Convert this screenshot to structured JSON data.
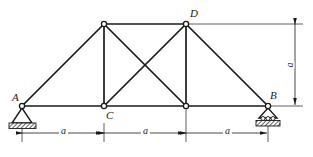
{
  "figure": {
    "type": "truss-diagram",
    "background_color": "#ffffff",
    "line_color": "#1a1a1a",
    "hatch_color": "#4d4d4d"
  },
  "nodes": [
    {
      "id": "A",
      "label": "A",
      "x": 22,
      "y": 106,
      "label_dx": -10,
      "label_dy": -14,
      "support": "pin"
    },
    {
      "id": "C",
      "label": "C",
      "x": 104,
      "y": 106,
      "label_dx": 2,
      "label_dy": 4,
      "support": "none"
    },
    {
      "id": "E",
      "label": "",
      "x": 186,
      "y": 106,
      "label_dx": 0,
      "label_dy": 0,
      "support": "none"
    },
    {
      "id": "B",
      "label": "B",
      "x": 268,
      "y": 106,
      "label_dx": 2,
      "label_dy": -16,
      "support": "roller"
    },
    {
      "id": "F",
      "label": "",
      "x": 104,
      "y": 24,
      "label_dx": 0,
      "label_dy": 0,
      "support": "none"
    },
    {
      "id": "D",
      "label": "D",
      "x": 186,
      "y": 24,
      "label_dx": 4,
      "label_dy": -16,
      "support": "none"
    }
  ],
  "members": [
    {
      "from": "A",
      "to": "C",
      "kind": "bottom-chord"
    },
    {
      "from": "C",
      "to": "E",
      "kind": "bottom-chord"
    },
    {
      "from": "E",
      "to": "B",
      "kind": "bottom-chord"
    },
    {
      "from": "F",
      "to": "D",
      "kind": "top-chord"
    },
    {
      "from": "A",
      "to": "F",
      "kind": "diagonal"
    },
    {
      "from": "F",
      "to": "C",
      "kind": "vertical"
    },
    {
      "from": "F",
      "to": "E",
      "kind": "diagonal"
    },
    {
      "from": "C",
      "to": "D",
      "kind": "diagonal"
    },
    {
      "from": "D",
      "to": "E",
      "kind": "vertical"
    },
    {
      "from": "D",
      "to": "B",
      "kind": "diagonal"
    }
  ],
  "dimensions": {
    "horizontal": [
      {
        "label": "a",
        "x1": 22,
        "x2": 104,
        "y": 133
      },
      {
        "label": "a",
        "x1": 104,
        "x2": 186,
        "y": 133
      },
      {
        "label": "a",
        "x1": 186,
        "x2": 268,
        "y": 133
      }
    ],
    "vertical": [
      {
        "label": "a",
        "x": 295,
        "y1": 24,
        "y2": 106
      }
    ]
  },
  "supports": {
    "pin": {
      "at": "A",
      "description": "pinned-support"
    },
    "roller": {
      "at": "B",
      "description": "roller-support",
      "roller_count": 3
    }
  }
}
